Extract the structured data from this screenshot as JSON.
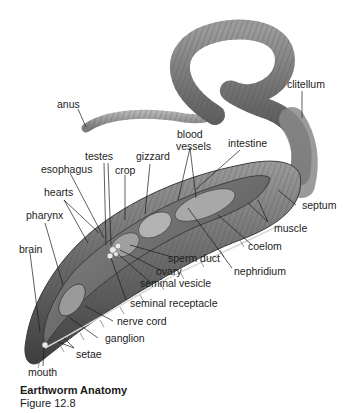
{
  "figure": {
    "title": "Earthworm Anatomy",
    "subtitle": "Figure 12.8"
  },
  "labels": {
    "anus": "anus",
    "clitellum": "clitellum",
    "blood": "blood",
    "vessels": "vessels",
    "intestine": "intestine",
    "testes": "testes",
    "gizzard": "gizzard",
    "esophagus": "esophagus",
    "crop": "crop",
    "hearts": "hearts",
    "pharynx": "pharynx",
    "brain": "brain",
    "septum": "septum",
    "muscle": "muscle",
    "coelom": "coelom",
    "sperm_duct": "sperm duct",
    "ovary": "ovary",
    "nephridium": "nephridium",
    "seminal_vesicle": "seminal vesicle",
    "seminal_receptacle": "seminal receptacle",
    "nerve_cord": "nerve cord",
    "ganglion": "ganglion",
    "setae": "setae",
    "mouth": "mouth"
  }
}
